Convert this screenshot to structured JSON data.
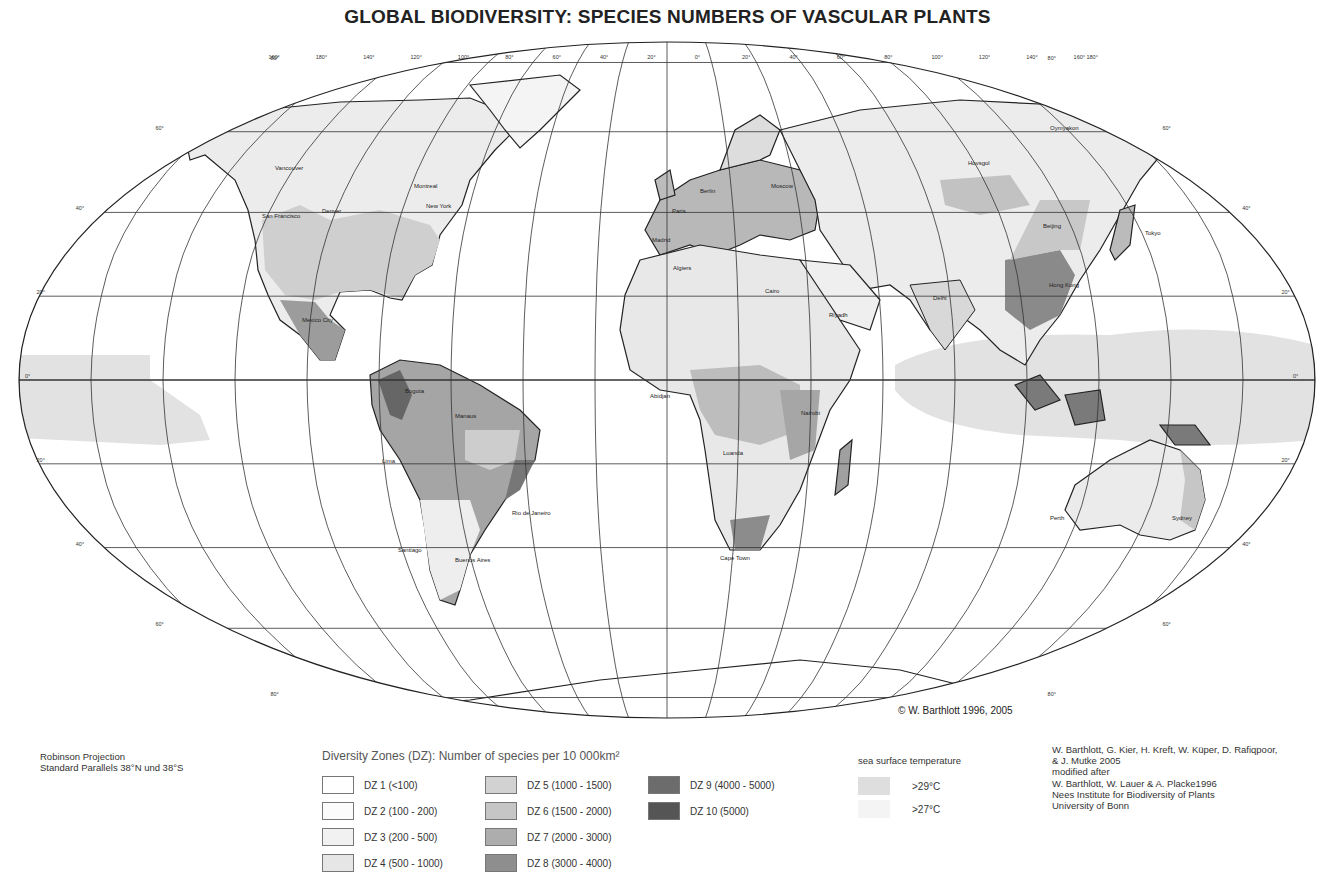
{
  "title": "GLOBAL BIODIVERSITY:  SPECIES NUMBERS OF VASCULAR PLANTS",
  "map": {
    "projection_note": [
      "Robinson Projection",
      "Standard Parallels 38°N und 38°S"
    ],
    "copyright": "© W. Barthlott 1996, 2005",
    "longitude_labels": [
      "160°",
      "180°",
      "140°",
      "120°",
      "100°",
      "80°",
      "60°",
      "40°",
      "20°",
      "0°",
      "20°",
      "40°",
      "60°",
      "80°",
      "100°",
      "120°",
      "140°",
      "160° 180°"
    ],
    "latitude_labels": [
      "80°",
      "60°",
      "40°",
      "20°",
      "0°",
      "20°",
      "40°",
      "60°",
      "80°"
    ],
    "cities": [
      {
        "name": "Vancouver"
      },
      {
        "name": "San Francisco"
      },
      {
        "name": "Denver"
      },
      {
        "name": "Montreal"
      },
      {
        "name": "New York"
      },
      {
        "name": "Mexico City"
      },
      {
        "name": "Bogota"
      },
      {
        "name": "Manaus"
      },
      {
        "name": "Lima"
      },
      {
        "name": "Rio de Janeiro"
      },
      {
        "name": "Santiago"
      },
      {
        "name": "Buenos Aires"
      },
      {
        "name": "Berlin"
      },
      {
        "name": "Paris"
      },
      {
        "name": "Madrid"
      },
      {
        "name": "Moscow"
      },
      {
        "name": "Algiers"
      },
      {
        "name": "Cairo"
      },
      {
        "name": "Riyadh"
      },
      {
        "name": "Abidjan"
      },
      {
        "name": "Nairobi"
      },
      {
        "name": "Luanda"
      },
      {
        "name": "Cape Town"
      },
      {
        "name": "Delhi"
      },
      {
        "name": "Hovsgol"
      },
      {
        "name": "Beijing"
      },
      {
        "name": "Tokyo"
      },
      {
        "name": "Hong Kong"
      },
      {
        "name": "Oymyakon"
      },
      {
        "name": "Perth"
      },
      {
        "name": "Sydney"
      }
    ]
  },
  "legend": {
    "title": "Diversity Zones (DZ): Number of species per 10 000km²",
    "zones": [
      {
        "label": "DZ 1 (<100)",
        "color": "#ffffff"
      },
      {
        "label": "DZ 2 (100 - 200)",
        "color": "#fbfbfb"
      },
      {
        "label": "DZ 3 (200 - 500)",
        "color": "#f1f1f1"
      },
      {
        "label": "DZ 4 (500 - 1000)",
        "color": "#e6e6e6"
      },
      {
        "label": "DZ 5 (1000 - 1500)",
        "color": "#d2d2d2"
      },
      {
        "label": "DZ 6 (1500 - 2000)",
        "color": "#c6c6c6"
      },
      {
        "label": "DZ 7 (2000 - 3000)",
        "color": "#adadad"
      },
      {
        "label": "DZ 8 (3000 - 4000)",
        "color": "#8e8e8e"
      },
      {
        "label": "DZ 9 (4000 - 5000)",
        "color": "#6c6c6c"
      },
      {
        "label": "DZ 10 (5000)",
        "color": "#555555"
      }
    ]
  },
  "sea_surface": {
    "title": "sea surface temperature",
    "items": [
      {
        "label": ">29°C",
        "color": "#dedede"
      },
      {
        "label": ">27°C",
        "color": "#f4f4f4"
      }
    ]
  },
  "credits": [
    "W. Barthlott, G. Kier, H. Kreft, W. Küper, D. Rafiqpoor,",
    "& J. Mutke 2005",
    "modified after",
    "W. Barthlott, W. Lauer & A. Placke1996",
    "Nees Institute for Biodiversity of Plants",
    "University of Bonn"
  ]
}
